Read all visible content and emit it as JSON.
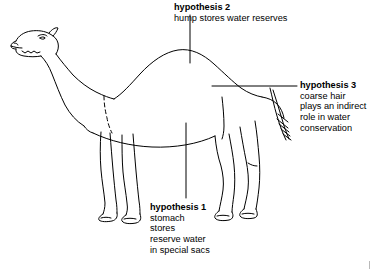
{
  "figure": {
    "caption_corner_mark": "|",
    "ink_color": "#000000",
    "background_color": "#ffffff",
    "annotations": [
      {
        "id": "hypothesis-2",
        "title": "hypothesis 2",
        "lines": [
          "hump stores water reserves"
        ],
        "leader": "vertical line from text down to top of hump"
      },
      {
        "id": "hypothesis-3",
        "title": "hypothesis 3",
        "lines": [
          "coarse hair",
          "plays an indirect",
          "role in water",
          "conservation"
        ],
        "leader": "horizontal line from text left to the tail"
      },
      {
        "id": "hypothesis-1",
        "title": "hypothesis 1",
        "lines": [
          "stomach",
          "stores",
          "reserve water",
          "in special sacs"
        ],
        "leader": "vertical line from belly down to text"
      }
    ]
  },
  "hypothesis2": {
    "title": "hypothesis 2",
    "line1": "hump stores water reserves"
  },
  "hypothesis3": {
    "title": "hypothesis 3",
    "line1": "coarse hair",
    "line2": "plays an indirect",
    "line3": "role in water",
    "line4": "conservation"
  },
  "hypothesis1": {
    "title": "hypothesis 1",
    "line1": "stomach",
    "line2": "stores",
    "line3": "reserve water",
    "line4": "in special sacs"
  }
}
